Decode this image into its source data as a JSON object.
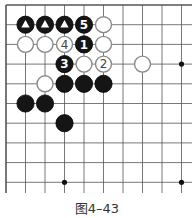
{
  "diagram": {
    "caption": "图4–43",
    "grid": {
      "cols": 10,
      "rows": 10,
      "origin_x": 6,
      "origin_y": 5,
      "spacing_x": 19.5,
      "spacing_y": 19.7,
      "right_extent": 192,
      "bottom_extent": 193,
      "line_color": "#555555",
      "border_top": true,
      "border_left": true
    },
    "star_points": [
      [
        9,
        3
      ],
      [
        3,
        9
      ],
      [
        9,
        9
      ]
    ],
    "stones": [
      {
        "col": 1,
        "row": 1,
        "color": "black",
        "mark": "triangle"
      },
      {
        "col": 2,
        "row": 1,
        "color": "black",
        "mark": "triangle"
      },
      {
        "col": 3,
        "row": 1,
        "color": "black",
        "mark": "triangle"
      },
      {
        "col": 4,
        "row": 1,
        "color": "black",
        "label": "5"
      },
      {
        "col": 5,
        "row": 1,
        "color": "white"
      },
      {
        "col": 1,
        "row": 2,
        "color": "white"
      },
      {
        "col": 2,
        "row": 2,
        "color": "white"
      },
      {
        "col": 3,
        "row": 2,
        "color": "white",
        "label": "4"
      },
      {
        "col": 4,
        "row": 2,
        "color": "black",
        "label": "1"
      },
      {
        "col": 5,
        "row": 2,
        "color": "white"
      },
      {
        "col": 3,
        "row": 3,
        "color": "black",
        "label": "3"
      },
      {
        "col": 4,
        "row": 3,
        "color": "white"
      },
      {
        "col": 5,
        "row": 3,
        "color": "white",
        "label": "2"
      },
      {
        "col": 7,
        "row": 3,
        "color": "white"
      },
      {
        "col": 2,
        "row": 4,
        "color": "white"
      },
      {
        "col": 3,
        "row": 4,
        "color": "black"
      },
      {
        "col": 4,
        "row": 4,
        "color": "black"
      },
      {
        "col": 5,
        "row": 4,
        "color": "black"
      },
      {
        "col": 1,
        "row": 5,
        "color": "black"
      },
      {
        "col": 2,
        "row": 5,
        "color": "black"
      },
      {
        "col": 3,
        "row": 6,
        "color": "black"
      }
    ]
  }
}
